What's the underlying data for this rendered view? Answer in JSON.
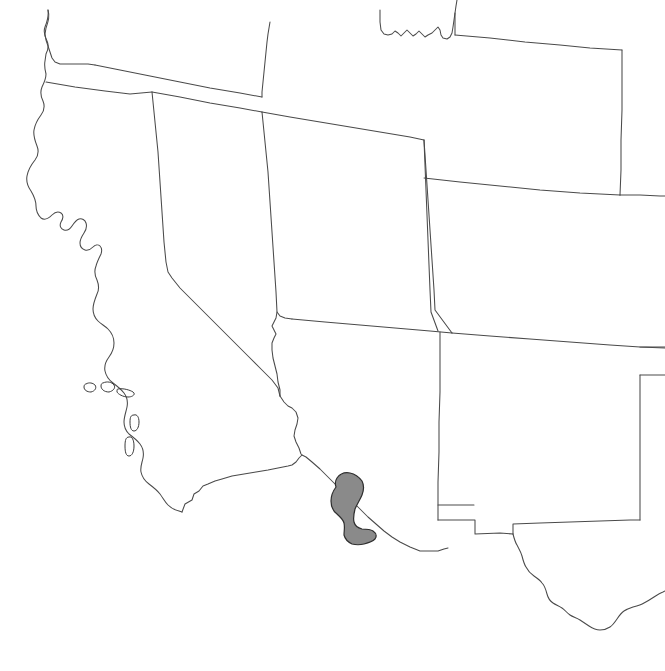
{
  "figure": {
    "kind": "distribution-range-map",
    "region": "Southwestern United States",
    "background_color": "#ffffff",
    "boundary_color": "#4a4a4a",
    "range_fill_color": "#8a8a8a",
    "range_outline_color": "#2e2e2e",
    "caption": ""
  },
  "legend": {
    "range_label": "",
    "visible": false
  },
  "map_data": {
    "type": "range-map",
    "projection": "equirectangular-approx",
    "extent_px": {
      "width": 665,
      "height": 671
    },
    "features": {
      "coastline": {
        "name": "pacific-coastline",
        "stroke": "#4a4a4a"
      },
      "state_boundaries": {
        "name": "state-boundaries",
        "stroke": "#4a4a4a"
      },
      "international_boundary": {
        "name": "us-mexico-border",
        "stroke": "#4a4a4a"
      },
      "islands": {
        "name": "channel-islands",
        "count": 5
      },
      "range_polygon": {
        "name": "species-range",
        "fill": "#8a8a8a",
        "outline": "#2e2e2e",
        "location": "Arizona-New Mexico-Sonora border region",
        "approx_center_px": [
          349,
          505
        ]
      }
    }
  }
}
